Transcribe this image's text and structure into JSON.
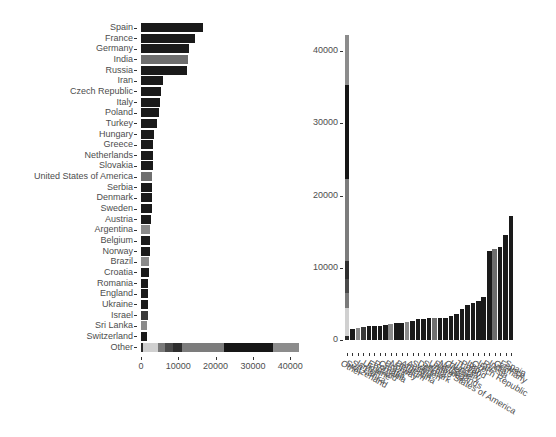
{
  "colors": {
    "dark": "#1a1a1a",
    "india": "#6e6e6e",
    "mid": "#707070",
    "light": "#d0d0d0",
    "gray": "#8a8a8a",
    "darkgray": "#3a3a3a"
  },
  "chart_data": [
    {
      "type": "bar",
      "orientation": "horizontal",
      "title": "",
      "xlabel": "",
      "ylabel": "",
      "xlim": [
        0,
        42300
      ],
      "x_ticks": [
        "0",
        "10000",
        "20000",
        "30000",
        "40000"
      ],
      "grid": false,
      "categories": [
        "Spain",
        "France",
        "Germany",
        "India",
        "Russia",
        "Iran",
        "Czech Republic",
        "Italy",
        "Poland",
        "Turkey",
        "Hungary",
        "Greece",
        "Netherlands",
        "Slovakia",
        "United States of America",
        "Serbia",
        "Denmark",
        "Sweden",
        "Austria",
        "Argentina",
        "Belgium",
        "Norway",
        "Brazil",
        "Croatia",
        "Romania",
        "England",
        "Ukraine",
        "Israel",
        "Sri Lanka",
        "Switzerland",
        "Other"
      ],
      "values": [
        16600,
        14500,
        12900,
        12600,
        12300,
        5900,
        5400,
        5100,
        4900,
        4300,
        3600,
        3300,
        3100,
        3100,
        3000,
        3000,
        2900,
        2900,
        2600,
        2500,
        2400,
        2300,
        2200,
        2100,
        2000,
        2000,
        1900,
        1800,
        1700,
        1500,
        42300
      ],
      "bar_colors": [
        "dark",
        "dark",
        "dark",
        "india",
        "dark",
        "dark",
        "dark",
        "dark",
        "dark",
        "dark",
        "dark",
        "dark",
        "dark",
        "dark",
        "mid",
        "dark",
        "dark",
        "dark",
        "dark",
        "gray",
        "dark",
        "dark",
        "gray",
        "dark",
        "dark",
        "dark",
        "dark",
        "darkgray",
        "gray",
        "dark",
        "stacked"
      ],
      "other_stack": [
        {
          "from": 0,
          "to": 500,
          "color": "#2a2a2a"
        },
        {
          "from": 500,
          "to": 4500,
          "color": "#d0d0d0"
        },
        {
          "from": 4500,
          "to": 6500,
          "color": "#7a7a7a"
        },
        {
          "from": 6500,
          "to": 8500,
          "color": "#4a4a4a"
        },
        {
          "from": 8500,
          "to": 11000,
          "color": "#2e2e2e"
        },
        {
          "from": 11000,
          "to": 22300,
          "color": "#7c7c7c"
        },
        {
          "from": 22300,
          "to": 35300,
          "color": "#161616"
        },
        {
          "from": 35300,
          "to": 42300,
          "color": "#8c8c8c"
        }
      ]
    },
    {
      "type": "bar",
      "orientation": "vertical",
      "title": "",
      "xlabel": "",
      "ylabel": "",
      "ylim": [
        0,
        42300
      ],
      "y_ticks": [
        "0",
        "10000",
        "20000",
        "30000",
        "40000"
      ],
      "grid": false,
      "categories": [
        "Other",
        "Switzerland",
        "Sri Lanka",
        "Israel",
        "Ukraine",
        "England",
        "Romania",
        "Croatia",
        "Brazil",
        "Norway",
        "Belgium",
        "Argentina",
        "Austria",
        "Sweden",
        "Denmark",
        "Serbia",
        "United States of America",
        "Slovakia",
        "Netherlands",
        "Greece",
        "Hungary",
        "Turkey",
        "Poland",
        "Italy",
        "Czech Republic",
        "Iran",
        "Russia",
        "India",
        "Germany",
        "France",
        "Spain"
      ],
      "values": [
        42300,
        1500,
        1700,
        1800,
        1900,
        2000,
        2000,
        2100,
        2200,
        2300,
        2400,
        2500,
        2600,
        2900,
        2900,
        3000,
        3000,
        3100,
        3100,
        3300,
        3600,
        4300,
        4900,
        5100,
        5400,
        5900,
        12300,
        12600,
        12900,
        14500,
        17200
      ]
    }
  ],
  "left": {
    "labels": [
      "Spain",
      "France",
      "Germany",
      "India",
      "Russia",
      "Iran",
      "Czech Republic",
      "Italy",
      "Poland",
      "Turkey",
      "Hungary",
      "Greece",
      "Netherlands",
      "Slovakia",
      "United States of America",
      "Serbia",
      "Denmark",
      "Sweden",
      "Austria",
      "Argentina",
      "Belgium",
      "Norway",
      "Brazil",
      "Croatia",
      "Romania",
      "England",
      "Ukraine",
      "Israel",
      "Sri Lanka",
      "Switzerland",
      "Other"
    ],
    "x_ticks": [
      "0",
      "10000",
      "20000",
      "30000",
      "40000"
    ]
  },
  "right": {
    "labels": [
      "Other",
      "Switzerland",
      "Sri Lanka",
      "Israel",
      "Ukraine",
      "England",
      "Romania",
      "Croatia",
      "Brazil",
      "Norway",
      "Belgium",
      "Argentina",
      "Austria",
      "Sweden",
      "Denmark",
      "Serbia",
      "United States of America",
      "Slovakia",
      "Netherlands",
      "Greece",
      "Hungary",
      "Turkey",
      "Poland",
      "Italy",
      "Czech Republic",
      "Iran",
      "Russia",
      "India",
      "Germany",
      "France",
      "Spain"
    ],
    "y_ticks": [
      "0",
      "10000",
      "20000",
      "30000",
      "40000"
    ]
  }
}
